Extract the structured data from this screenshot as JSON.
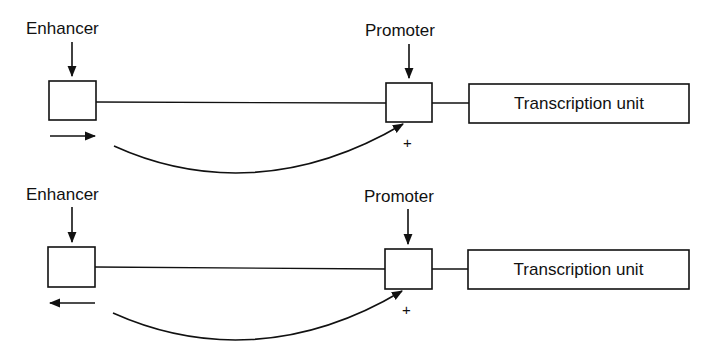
{
  "diagram": {
    "colors": {
      "stroke": "#111111",
      "background": "#ffffff"
    },
    "panels": [
      {
        "id": "top",
        "enhancer_label": "Enhancer",
        "promoter_label": "Promoter",
        "transcription_unit_label": "Transcription unit",
        "orientation_arrow": "right",
        "activation_sign": "+"
      },
      {
        "id": "bottom",
        "enhancer_label": "Enhancer",
        "promoter_label": "Promoter",
        "transcription_unit_label": "Transcription unit",
        "orientation_arrow": "left",
        "activation_sign": "+"
      }
    ]
  }
}
